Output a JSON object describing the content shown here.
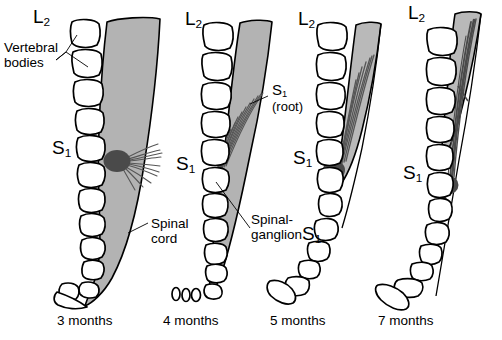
{
  "figure": {
    "colors": {
      "background": "#ffffff",
      "outline": "#000000",
      "cord_fill": "#b3b3b3",
      "cord_fill_light": "#c4c4c4",
      "ganglion_fill": "#4a4a4a",
      "root_fill": "#565656",
      "leader_line": "#000000"
    }
  },
  "annotations": {
    "vertebral_bodies": "Vertebral\nbodies",
    "vertebral_bodies_line1": "Vertebral",
    "vertebral_bodies_line2": "bodies",
    "spinal_cord_line1": "Spinal",
    "spinal_cord_line2": "cord",
    "spinal_ganglion_line1": "Spinal-",
    "spinal_ganglion_line2": "ganglion",
    "s1_root_label": "S",
    "s1_root_sub": "1",
    "s1_root_paren": "(root)",
    "segment_L": "L",
    "segment_L_sub": "2",
    "segment_S": "S",
    "segment_S_sub": "1"
  },
  "panels": [
    {
      "id": "panel-3-months",
      "caption": "3 months",
      "age_months": 3,
      "segment_top": "L",
      "segment_top_sub": "2",
      "segment_mid": "S",
      "segment_mid_sub": "1",
      "cord_extent": "full-to-sacrum",
      "description": "Spinal cord extends the entire length of the vertebral canal to the sacral tip; S1 root exits horizontally at the S1 vertebral level."
    },
    {
      "id": "panel-4-months",
      "caption": "4 months",
      "age_months": 4,
      "segment_top": "L",
      "segment_top_sub": "2",
      "segment_mid": "S",
      "segment_mid_sub": "1",
      "cord_extent": "to-mid-sacrum",
      "description": "Cord terminus begins to ascend; S1 nerve root elongates and runs obliquely downward to the S1 foramen."
    },
    {
      "id": "panel-5-months",
      "caption": "5 months",
      "age_months": 5,
      "segment_top": "L",
      "segment_top_sub": "2",
      "segment_mid": "S",
      "segment_mid_sub": "1",
      "segment_lower": "S",
      "segment_lower_sub": "1",
      "cord_extent": "to-upper-sacrum",
      "description": "Cord terminus has ascended further; S1 root is markedly longer and more oblique."
    },
    {
      "id": "panel-7-months",
      "caption": "7 months",
      "age_months": 7,
      "segment_top": "L",
      "segment_top_sub": "2",
      "segment_mid": "S",
      "segment_mid_sub": "1",
      "cord_extent": "to-lumbar",
      "description": "Cord terminus lies at the lumbar level; the S1 root forms a long descending strand within the cauda equina."
    }
  ]
}
